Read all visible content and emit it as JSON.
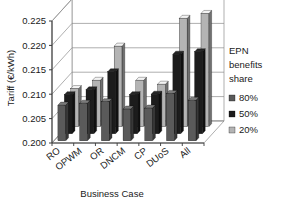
{
  "chart_data": {
    "type": "bar",
    "title": "",
    "subtitle": "",
    "xlabel": "Business Case",
    "ylabel": "Tariff (€/kWh)",
    "categories": [
      "RO",
      "OPWM",
      "OR",
      "DNCM",
      "CP",
      "DUoS",
      "All"
    ],
    "ylim": [
      0.2,
      0.225
    ],
    "yticks": [
      "0.200",
      "0.205",
      "0.210",
      "0.215",
      "0.220",
      "0.225"
    ],
    "ytick_values": [
      0.2,
      0.205,
      0.21,
      0.215,
      0.22,
      0.225
    ],
    "grid": true,
    "three_d": true,
    "legend_position": "right",
    "legend_title": "EPN benefits share",
    "series": [
      {
        "name": "80%",
        "color": "#5a5a5a",
        "values": [
          0.2073,
          0.2077,
          0.208,
          0.2065,
          0.2067,
          0.2097,
          0.2083
        ]
      },
      {
        "name": "50%",
        "color": "#1c1c1c",
        "values": [
          0.208,
          0.209,
          0.2127,
          0.208,
          0.2081,
          0.2163,
          0.2168
        ]
      },
      {
        "name": "20%",
        "color": "#b4b4b4",
        "values": [
          0.2078,
          0.2095,
          0.2165,
          0.2095,
          0.2087,
          0.2222,
          0.2232
        ]
      }
    ]
  },
  "axes": {
    "y_title": "Tariff (€/kWh)",
    "x_title": "Business Case"
  },
  "legend": {
    "title_lines": [
      "EPN",
      "benefits",
      "share"
    ],
    "entries": [
      {
        "label": "80%",
        "swatch": "#5a5a5a"
      },
      {
        "label": "50%",
        "swatch": "#1c1c1c"
      },
      {
        "label": "20%",
        "swatch": "#b4b4b4"
      }
    ]
  },
  "yticks": [
    {
      "label": "0.225"
    },
    {
      "label": "0.220"
    },
    {
      "label": "0.215"
    },
    {
      "label": "0.210"
    },
    {
      "label": "0.205"
    },
    {
      "label": "0.200"
    }
  ],
  "categories": [
    {
      "label": "RO"
    },
    {
      "label": "OPWM"
    },
    {
      "label": "OR"
    },
    {
      "label": "DNCM"
    },
    {
      "label": "CP"
    },
    {
      "label": "DUoS"
    },
    {
      "label": "All"
    }
  ]
}
